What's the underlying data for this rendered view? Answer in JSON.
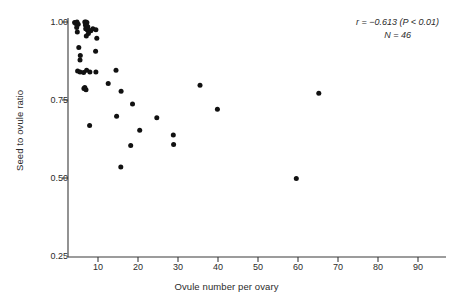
{
  "chart_data": {
    "type": "scatter",
    "title": "",
    "xlabel": "Ovule number per ovary",
    "ylabel": "Seed to ovule ratio",
    "xlim": [
      0,
      96
    ],
    "ylim": [
      0.25,
      1.0
    ],
    "xticks": [
      10,
      20,
      30,
      40,
      50,
      60,
      70,
      80,
      90
    ],
    "xtick_labels": [
      "10",
      "20",
      "30",
      "40",
      "50",
      "60",
      "70",
      "80",
      "90"
    ],
    "yticks": [
      0.25,
      0.5,
      0.75,
      1.0
    ],
    "ytick_labels": [
      "0.25",
      "0.50",
      "0.75",
      "1.00"
    ],
    "grid": false,
    "legend": null,
    "marker": "filled-circle",
    "marker_color": "#111111",
    "annotations": [
      {
        "text_r": "r = −0.613 (P < 0.01)",
        "text_n": "N = 46",
        "position": "top-right"
      }
    ],
    "statistics": {
      "r": -0.613,
      "p_text": "P < 0.01",
      "n": 46
    },
    "points": [
      {
        "x": 2.2,
        "y": 0.998
      },
      {
        "x": 2.6,
        "y": 0.995
      },
      {
        "x": 3.0,
        "y": 1.0
      },
      {
        "x": 3.4,
        "y": 0.993
      },
      {
        "x": 2.9,
        "y": 0.982
      },
      {
        "x": 3.1,
        "y": 0.968
      },
      {
        "x": 5.6,
        "y": 1.0
      },
      {
        "x": 6.0,
        "y": 1.0
      },
      {
        "x": 6.3,
        "y": 0.998
      },
      {
        "x": 5.8,
        "y": 0.99
      },
      {
        "x": 6.2,
        "y": 0.988
      },
      {
        "x": 6.6,
        "y": 0.985
      },
      {
        "x": 5.9,
        "y": 0.978
      },
      {
        "x": 6.4,
        "y": 0.975
      },
      {
        "x": 7.0,
        "y": 0.973
      },
      {
        "x": 6.8,
        "y": 0.963
      },
      {
        "x": 7.6,
        "y": 0.972
      },
      {
        "x": 8.3,
        "y": 0.978
      },
      {
        "x": 9.3,
        "y": 0.975
      },
      {
        "x": 6.1,
        "y": 0.955
      },
      {
        "x": 9.6,
        "y": 0.948
      },
      {
        "x": 3.6,
        "y": 0.918
      },
      {
        "x": 9.2,
        "y": 0.906
      },
      {
        "x": 4.1,
        "y": 0.893
      },
      {
        "x": 4.0,
        "y": 0.878
      },
      {
        "x": 3.2,
        "y": 0.843
      },
      {
        "x": 4.0,
        "y": 0.84
      },
      {
        "x": 5.2,
        "y": 0.838
      },
      {
        "x": 6.2,
        "y": 0.845
      },
      {
        "x": 7.3,
        "y": 0.84
      },
      {
        "x": 9.3,
        "y": 0.84
      },
      {
        "x": 16.0,
        "y": 0.845
      },
      {
        "x": 13.4,
        "y": 0.803
      },
      {
        "x": 5.3,
        "y": 0.787
      },
      {
        "x": 5.6,
        "y": 0.79
      },
      {
        "x": 6.0,
        "y": 0.783
      },
      {
        "x": 17.7,
        "y": 0.778
      },
      {
        "x": 44.0,
        "y": 0.797
      },
      {
        "x": 83.6,
        "y": 0.772
      },
      {
        "x": 21.5,
        "y": 0.737
      },
      {
        "x": 49.8,
        "y": 0.72
      },
      {
        "x": 16.2,
        "y": 0.698
      },
      {
        "x": 29.6,
        "y": 0.693
      },
      {
        "x": 7.2,
        "y": 0.668
      },
      {
        "x": 23.9,
        "y": 0.653
      },
      {
        "x": 35.1,
        "y": 0.638
      },
      {
        "x": 35.2,
        "y": 0.607
      },
      {
        "x": 20.9,
        "y": 0.604
      },
      {
        "x": 17.6,
        "y": 0.535
      },
      {
        "x": 76.1,
        "y": 0.498
      }
    ]
  },
  "axes": {
    "y_title": "Seed to ovule ratio",
    "x_title": "Ovule number per ovary",
    "y_tick_labels": [
      "1.00",
      "0.75",
      "0.50",
      "0.25"
    ],
    "x_tick_labels": [
      "10",
      "20",
      "30",
      "40",
      "50",
      "60",
      "70",
      "80",
      "90"
    ]
  },
  "annotation": {
    "correlation_line": "r = −0.613 (P < 0.01)",
    "sample_line": "N = 46"
  }
}
